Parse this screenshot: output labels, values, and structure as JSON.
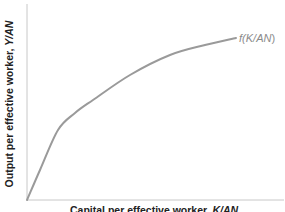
{
  "chart_data": {
    "type": "line",
    "title": "",
    "xlabel": "Capital per effective worker, K/AN",
    "ylabel": "Output per effective worker, Y/AN",
    "ylabel_plain": "Output per effective worker, ",
    "ylabel_var": "Y/AN",
    "xlabel_plain": "Capital per effective worker, ",
    "xlabel_var": "K/AN",
    "grid": false,
    "legend": "none",
    "ticks": "none",
    "series": [
      {
        "name": "f(K/AN)",
        "label_prefix": "f(",
        "label_var": "K/AN",
        "label_suffix": ")",
        "color": "#9a9a9a",
        "shape": "concave increasing from origin",
        "points_px": [
          [
            27,
            200
          ],
          [
            40,
            170
          ],
          [
            58,
            130
          ],
          [
            75,
            113
          ],
          [
            93,
            100
          ],
          [
            130,
            75
          ],
          [
            170,
            55
          ],
          [
            205,
            45
          ],
          [
            236,
            38
          ]
        ]
      }
    ],
    "colors": {
      "axis": "#c8c8c8",
      "curve": "#9a9a9a",
      "text": "#222222",
      "curve_label": "#8a8a8a"
    }
  }
}
